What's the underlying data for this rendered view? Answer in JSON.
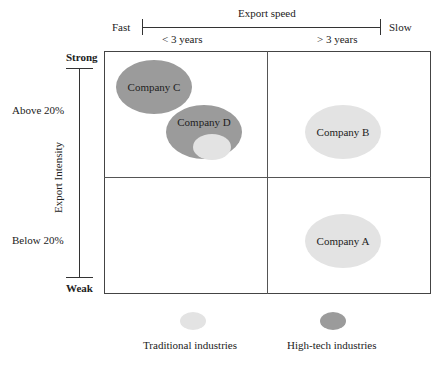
{
  "colors": {
    "traditional": "#e3e3e3",
    "high_tech": "#9b9b9b",
    "line": "#333333"
  },
  "x_axis": {
    "title": "Export speed",
    "left_end": "Fast",
    "right_end": "Slow",
    "left_category": "< 3 years",
    "right_category": "> 3 years"
  },
  "y_axis": {
    "title": "Export Intensity",
    "top_end": "Strong",
    "bottom_end": "Weak",
    "top_category": "Above 20%",
    "bottom_category": "Below 20%"
  },
  "companies": [
    {
      "label": "Company C",
      "type": "High-tech",
      "quadrant": "Fast / Strong"
    },
    {
      "label": "Company D",
      "type": "High-tech (with traditional component)",
      "quadrant": "Fast / Strong"
    },
    {
      "label": "Company B",
      "type": "Traditional",
      "quadrant": "Slow / Strong"
    },
    {
      "label": "Company A",
      "type": "Traditional",
      "quadrant": "Slow / Weak"
    }
  ],
  "legend": [
    {
      "label": "Traditional industries",
      "color": "#e3e3e3"
    },
    {
      "label": "High-tech industries",
      "color": "#9b9b9b"
    }
  ]
}
